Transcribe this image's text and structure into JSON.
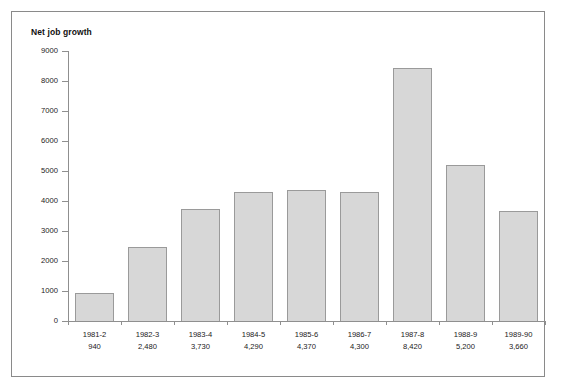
{
  "chart_data": {
    "type": "bar",
    "title": "Net job growth",
    "xlabel": "",
    "ylabel": "",
    "ylim": [
      0,
      9000
    ],
    "ytick_step": 1000,
    "grid": false,
    "legend": "none",
    "bar_fill_color": "#d7d7d7",
    "bar_border_color": "#9a9a9a",
    "axis_color": "#8f8f8f",
    "frame_border_color": "#8a8a8a",
    "background_color": "#ffffff",
    "categories": [
      "1981-2",
      "1982-3",
      "1983-4",
      "1984-5",
      "1985-6",
      "1986-7",
      "1987-8",
      "1988-9",
      "1989-90"
    ],
    "values": [
      940,
      2480,
      3730,
      4290,
      4370,
      4300,
      8420,
      5200,
      3660
    ],
    "value_labels": [
      "940",
      "2,480",
      "3,730",
      "4,290",
      "4,370",
      "4,300",
      "8,420",
      "5,200",
      "3,660"
    ],
    "ytick_labels": [
      "0",
      "1000",
      "2000",
      "3000",
      "4000",
      "5000",
      "6000",
      "7000",
      "8000",
      "9000"
    ],
    "ytick_values": [
      0,
      1000,
      2000,
      3000,
      4000,
      5000,
      6000,
      7000,
      8000,
      9000
    ]
  }
}
